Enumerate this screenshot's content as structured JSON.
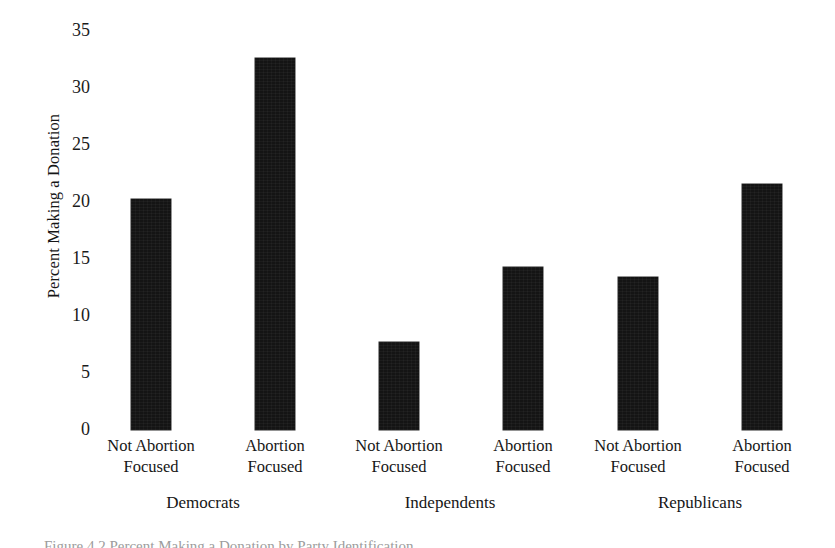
{
  "chart_data": {
    "type": "bar",
    "title": "",
    "xlabel": "",
    "ylabel": "Percent Making a Donation",
    "ylim": [
      0,
      35
    ],
    "yticks": [
      0,
      5,
      10,
      15,
      20,
      25,
      30,
      35
    ],
    "ytick_labels": [
      "0",
      "5",
      "10",
      "15",
      "20",
      "25",
      "30",
      "35"
    ],
    "grid": false,
    "legend": "none",
    "categories": [
      "Not Abortion Focused",
      "Abortion Focused",
      "Not Abortion Focused",
      "Abortion Focused",
      "Not Abortion Focused",
      "Abortion Focused"
    ],
    "values": [
      19.7,
      31.8,
      7.5,
      13.9,
      13.1,
      21.0
    ],
    "groups": [
      {
        "name": "Democrats",
        "categories": [
          "Not Abortion Focused",
          "Abortion Focused"
        ],
        "values": [
          19.7,
          31.8
        ]
      },
      {
        "name": "Independents",
        "categories": [
          "Not Abortion Focused",
          "Abortion Focused"
        ],
        "values": [
          7.5,
          13.9
        ]
      },
      {
        "name": "Republicans",
        "categories": [
          "Not Abortion Focused",
          "Abortion Focused"
        ],
        "values": [
          13.1,
          21.0
        ]
      }
    ],
    "bar_color": "#141414"
  },
  "axes": {
    "y_title": "Percent Making a Donation",
    "y_ticks": [
      {
        "label": "35",
        "value": 35
      },
      {
        "label": "30",
        "value": 30
      },
      {
        "label": "25",
        "value": 25
      },
      {
        "label": "20",
        "value": 20
      },
      {
        "label": "15",
        "value": 15
      },
      {
        "label": "10",
        "value": 10
      },
      {
        "label": "5",
        "value": 5
      },
      {
        "label": "0",
        "value": 0
      }
    ]
  },
  "x_categories": [
    {
      "line1": "Not Abortion",
      "line2": "Focused"
    },
    {
      "line1": "Abortion",
      "line2": "Focused"
    },
    {
      "line1": "Not Abortion",
      "line2": "Focused"
    },
    {
      "line1": "Abortion",
      "line2": "Focused"
    },
    {
      "line1": "Not Abortion",
      "line2": "Focused"
    },
    {
      "line1": "Abortion",
      "line2": "Focused"
    }
  ],
  "x_groups": [
    {
      "label": "Democrats"
    },
    {
      "label": "Independents"
    },
    {
      "label": "Republicans"
    }
  ],
  "caption": {
    "partial_text": "Figure 4.2 Percent Making a Donation by Party Identification"
  }
}
